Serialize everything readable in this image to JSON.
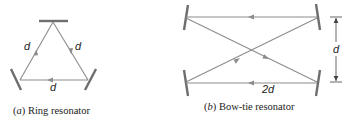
{
  "figure": {
    "panels": [
      {
        "id": "a",
        "caption_tag": "a",
        "caption_text": "Ring resonator",
        "labels": {
          "left_side": "d",
          "right_side": "d",
          "bottom_side": "d"
        }
      },
      {
        "id": "b",
        "caption_tag": "b",
        "caption_text": "Bow-tie resonator",
        "labels": {
          "mirror_separation": "d",
          "bottom_length": "2d"
        }
      }
    ],
    "colors": {
      "beam": "#8c8c8c",
      "mirror": "#6e6e6e",
      "text": "#222222",
      "background": "#ffffff"
    }
  }
}
